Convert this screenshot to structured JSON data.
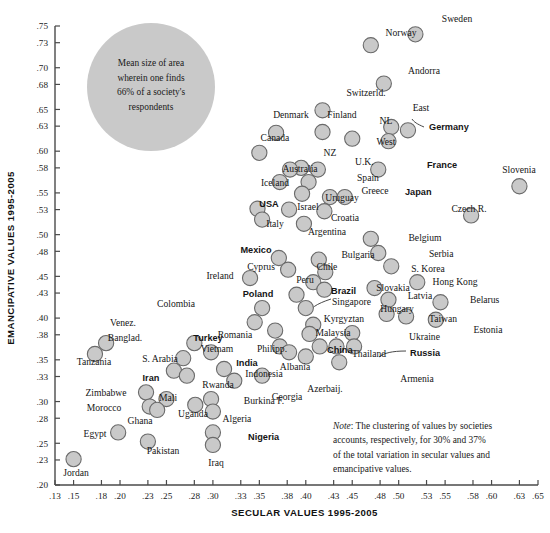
{
  "chart_data": {
    "type": "scatter",
    "title": "",
    "xlabel": "SECULAR VALUES 1995-2005",
    "ylabel": "EMANCIPATIVE VALUES 1995-2005",
    "xlim": [
      0.13,
      0.65
    ],
    "ylim": [
      0.2,
      0.75
    ],
    "grid": false,
    "legend": null,
    "xticks": [
      ".13",
      ".15",
      ".18",
      ".20",
      ".23",
      ".25",
      ".28",
      ".30",
      ".33",
      ".35",
      ".38",
      ".40",
      ".43",
      ".45",
      ".48",
      ".50",
      ".53",
      ".55",
      ".58",
      ".60",
      ".63",
      ".65"
    ],
    "xtick_values": [
      0.13,
      0.15,
      0.18,
      0.2,
      0.23,
      0.25,
      0.28,
      0.3,
      0.33,
      0.35,
      0.38,
      0.4,
      0.43,
      0.45,
      0.48,
      0.5,
      0.53,
      0.55,
      0.58,
      0.6,
      0.63,
      0.65
    ],
    "yticks": [
      ".75",
      ".73",
      ".70",
      ".68",
      ".65",
      ".63",
      ".60",
      ".58",
      ".55",
      ".53",
      ".50",
      ".48",
      ".45",
      ".43",
      ".40",
      ".38",
      ".35",
      ".33",
      ".30",
      ".28",
      ".25",
      ".23",
      ".20"
    ],
    "ytick_values": [
      0.75,
      0.73,
      0.7,
      0.68,
      0.65,
      0.63,
      0.6,
      0.58,
      0.55,
      0.53,
      0.5,
      0.48,
      0.45,
      0.43,
      0.4,
      0.38,
      0.35,
      0.33,
      0.3,
      0.28,
      0.25,
      0.23,
      0.2
    ],
    "marker_fill": "#c9c9c9",
    "marker_stroke": "#6a6a6a",
    "points": [
      {
        "label": "Sweden",
        "x": 0.518,
        "y": 0.74,
        "bold": false,
        "lx": 457,
        "ly": 22,
        "anchor": "middle"
      },
      {
        "label": "Norway",
        "x": 0.47,
        "y": 0.727,
        "bold": false,
        "lx": 401,
        "ly": 36,
        "anchor": "middle"
      },
      {
        "label": "Andorra",
        "x": 0.484,
        "y": 0.681,
        "bold": false,
        "lx": 424,
        "ly": 74,
        "anchor": "middle"
      },
      {
        "label": "Switzerld.",
        "x": 0.418,
        "y": 0.649,
        "bold": false,
        "lx": 366,
        "ly": 96,
        "anchor": "middle"
      },
      {
        "label": "Denmark",
        "x": 0.368,
        "y": 0.622,
        "bold": false,
        "lx": 291,
        "ly": 118,
        "anchor": "middle"
      },
      {
        "label": "Finland",
        "x": 0.418,
        "y": 0.623,
        "bold": false,
        "lx": 342,
        "ly": 118,
        "anchor": "middle"
      },
      {
        "label": "NL",
        "x": 0.45,
        "y": 0.615,
        "bold": false,
        "lx": 386,
        "ly": 124,
        "anchor": "middle"
      },
      {
        "label": "East",
        "x": 0.492,
        "y": 0.629,
        "bold": false,
        "lx": 421,
        "ly": 111,
        "anchor": "middle"
      },
      {
        "label": "Germany",
        "x": 0.51,
        "y": 0.625,
        "bold": true,
        "lx": 429,
        "ly": 130,
        "anchor": "start"
      },
      {
        "label": "West",
        "x": 0.489,
        "y": 0.612,
        "bold": false,
        "lx": 386,
        "ly": 145,
        "anchor": "middle"
      },
      {
        "label": "Canada",
        "x": 0.35,
        "y": 0.598,
        "bold": false,
        "lx": 275,
        "ly": 141,
        "anchor": "middle"
      },
      {
        "label": "NZ",
        "x": 0.395,
        "y": 0.58,
        "bold": false,
        "lx": 330,
        "ly": 156,
        "anchor": "middle"
      },
      {
        "label": "U.K.",
        "x": 0.413,
        "y": 0.578,
        "bold": false,
        "lx": 355,
        "ly": 165,
        "anchor": "start"
      },
      {
        "label": "Australia",
        "x": 0.383,
        "y": 0.578,
        "bold": false,
        "lx": 300,
        "ly": 172,
        "anchor": "middle"
      },
      {
        "label": "France",
        "x": 0.478,
        "y": 0.578,
        "bold": true,
        "lx": 427,
        "ly": 168,
        "anchor": "start"
      },
      {
        "label": "Iceland",
        "x": 0.372,
        "y": 0.563,
        "bold": false,
        "lx": 275,
        "ly": 186,
        "anchor": "middle"
      },
      {
        "label": "Spain",
        "x": 0.403,
        "y": 0.563,
        "bold": false,
        "lx": 357,
        "ly": 181,
        "anchor": "start"
      },
      {
        "label": "Slovenia",
        "x": 0.63,
        "y": 0.558,
        "bold": false,
        "lx": 519,
        "ly": 173,
        "anchor": "middle"
      },
      {
        "label": "Uruguay",
        "x": 0.396,
        "y": 0.549,
        "bold": false,
        "lx": 342,
        "ly": 201,
        "anchor": "middle"
      },
      {
        "label": "Greece",
        "x": 0.426,
        "y": 0.545,
        "bold": false,
        "lx": 375,
        "ly": 194,
        "anchor": "middle"
      },
      {
        "label": "Japan",
        "x": 0.442,
        "y": 0.545,
        "bold": true,
        "lx": 405,
        "ly": 195,
        "anchor": "start"
      },
      {
        "label": "USA",
        "x": 0.348,
        "y": 0.531,
        "bold": true,
        "lx": 269,
        "ly": 207,
        "anchor": "middle"
      },
      {
        "label": "Israel",
        "x": 0.382,
        "y": 0.53,
        "bold": false,
        "lx": 308,
        "ly": 210,
        "anchor": "middle"
      },
      {
        "label": "Croatia",
        "x": 0.42,
        "y": 0.528,
        "bold": false,
        "lx": 345,
        "ly": 221,
        "anchor": "middle"
      },
      {
        "label": "Czech R.",
        "x": 0.578,
        "y": 0.523,
        "bold": false,
        "lx": 469,
        "ly": 212,
        "anchor": "middle"
      },
      {
        "label": "Italy",
        "x": 0.353,
        "y": 0.518,
        "bold": false,
        "lx": 275,
        "ly": 227,
        "anchor": "middle"
      },
      {
        "label": "Argentina",
        "x": 0.398,
        "y": 0.513,
        "bold": false,
        "lx": 327,
        "ly": 235,
        "anchor": "middle"
      },
      {
        "label": "Belgium",
        "x": 0.47,
        "y": 0.495,
        "bold": false,
        "lx": 425,
        "ly": 241,
        "anchor": "middle"
      },
      {
        "label": "Mexico",
        "x": 0.371,
        "y": 0.472,
        "bold": true,
        "lx": 256,
        "ly": 253,
        "anchor": "middle"
      },
      {
        "label": "Bulgaria",
        "x": 0.414,
        "y": 0.47,
        "bold": false,
        "lx": 358,
        "ly": 258,
        "anchor": "middle"
      },
      {
        "label": "Serbia",
        "x": 0.478,
        "y": 0.478,
        "bold": false,
        "lx": 429,
        "ly": 257,
        "anchor": "start"
      },
      {
        "label": "Cyprus",
        "x": 0.381,
        "y": 0.458,
        "bold": false,
        "lx": 261,
        "ly": 270,
        "anchor": "middle"
      },
      {
        "label": "Chile",
        "x": 0.421,
        "y": 0.455,
        "bold": false,
        "lx": 327,
        "ly": 270,
        "anchor": "middle"
      },
      {
        "label": "S. Korea",
        "x": 0.492,
        "y": 0.462,
        "bold": false,
        "lx": 428,
        "ly": 272,
        "anchor": "middle"
      },
      {
        "label": "Ireland",
        "x": 0.34,
        "y": 0.448,
        "bold": false,
        "lx": 220,
        "ly": 279,
        "anchor": "middle"
      },
      {
        "label": "Peru",
        "x": 0.408,
        "y": 0.443,
        "bold": false,
        "lx": 305,
        "ly": 283,
        "anchor": "middle"
      },
      {
        "label": "Hong Kong",
        "x": 0.52,
        "y": 0.443,
        "bold": false,
        "lx": 455,
        "ly": 285,
        "anchor": "middle"
      },
      {
        "label": "Brazil",
        "x": 0.42,
        "y": 0.434,
        "bold": true,
        "lx": 331,
        "ly": 294,
        "anchor": "start"
      },
      {
        "label": "Slovakia",
        "x": 0.474,
        "y": 0.436,
        "bold": false,
        "lx": 393,
        "ly": 291,
        "anchor": "middle"
      },
      {
        "label": "Poland",
        "x": 0.39,
        "y": 0.428,
        "bold": true,
        "lx": 258,
        "ly": 297,
        "anchor": "middle"
      },
      {
        "label": "Latvia",
        "x": 0.489,
        "y": 0.422,
        "bold": false,
        "lx": 420,
        "ly": 299,
        "anchor": "middle"
      },
      {
        "label": "Belarus",
        "x": 0.545,
        "y": 0.419,
        "bold": false,
        "lx": 470,
        "ly": 303,
        "anchor": "start"
      },
      {
        "label": "Colombia",
        "x": 0.353,
        "y": 0.412,
        "bold": false,
        "lx": 176,
        "ly": 307,
        "anchor": "middle"
      },
      {
        "label": "Singapore",
        "x": 0.4,
        "y": 0.412,
        "bold": false,
        "lx": 332,
        "ly": 305,
        "anchor": "start"
      },
      {
        "label": "Hungary",
        "x": 0.487,
        "y": 0.405,
        "bold": false,
        "lx": 397,
        "ly": 312,
        "anchor": "middle"
      },
      {
        "label": "Taiwan",
        "x": 0.508,
        "y": 0.402,
        "bold": false,
        "lx": 443,
        "ly": 322,
        "anchor": "middle"
      },
      {
        "label": "Estonia",
        "x": 0.54,
        "y": 0.398,
        "bold": false,
        "lx": 488,
        "ly": 333,
        "anchor": "middle"
      },
      {
        "label": "Venez.",
        "x": 0.345,
        "y": 0.395,
        "bold": false,
        "lx": 123,
        "ly": 326,
        "anchor": "middle"
      },
      {
        "label": "Kyrgyztan",
        "x": 0.408,
        "y": 0.392,
        "bold": false,
        "lx": 344,
        "ly": 322,
        "anchor": "middle"
      },
      {
        "label": "Romania",
        "x": 0.367,
        "y": 0.385,
        "bold": false,
        "lx": 235,
        "ly": 338,
        "anchor": "middle"
      },
      {
        "label": "Malaysia",
        "x": 0.404,
        "y": 0.381,
        "bold": false,
        "lx": 333,
        "ly": 336,
        "anchor": "middle"
      },
      {
        "label": "Ukraine",
        "x": 0.45,
        "y": 0.382,
        "bold": false,
        "lx": 409,
        "ly": 340,
        "anchor": "start"
      },
      {
        "label": "Banglad.",
        "x": 0.185,
        "y": 0.37,
        "bold": false,
        "lx": 125,
        "ly": 341,
        "anchor": "middle"
      },
      {
        "label": "Turkey",
        "x": 0.28,
        "y": 0.37,
        "bold": true,
        "lx": 208,
        "ly": 341,
        "anchor": "middle"
      },
      {
        "label": "Philipp.",
        "x": 0.372,
        "y": 0.366,
        "bold": false,
        "lx": 272,
        "ly": 352,
        "anchor": "middle"
      },
      {
        "label": "Vietnam",
        "x": 0.298,
        "y": 0.359,
        "bold": false,
        "lx": 217,
        "ly": 352,
        "anchor": "middle"
      },
      {
        "label": "India",
        "x": 0.382,
        "y": 0.359,
        "bold": true,
        "lx": 247,
        "ly": 366,
        "anchor": "middle"
      },
      {
        "label": "China",
        "x": 0.415,
        "y": 0.366,
        "bold": true,
        "lx": 327,
        "ly": 353,
        "anchor": "start"
      },
      {
        "label": "Thailand",
        "x": 0.433,
        "y": 0.366,
        "bold": false,
        "lx": 352,
        "ly": 357,
        "anchor": "start"
      },
      {
        "label": "Russia",
        "x": 0.452,
        "y": 0.366,
        "bold": true,
        "lx": 410,
        "ly": 356,
        "anchor": "start"
      },
      {
        "label": "Tanzania",
        "x": 0.173,
        "y": 0.357,
        "bold": false,
        "lx": 94,
        "ly": 365,
        "anchor": "middle"
      },
      {
        "label": "S. Arabia",
        "x": 0.268,
        "y": 0.352,
        "bold": false,
        "lx": 160,
        "ly": 362,
        "anchor": "middle"
      },
      {
        "label": "Albania",
        "x": 0.4,
        "y": 0.354,
        "bold": false,
        "lx": 295,
        "ly": 370,
        "anchor": "middle"
      },
      {
        "label": "Iran",
        "x": 0.258,
        "y": 0.337,
        "bold": true,
        "lx": 151,
        "ly": 381,
        "anchor": "middle"
      },
      {
        "label": "Indonesia",
        "x": 0.312,
        "y": 0.339,
        "bold": false,
        "lx": 264,
        "ly": 377,
        "anchor": "middle"
      },
      {
        "label": "Armenia",
        "x": 0.436,
        "y": 0.347,
        "bold": false,
        "lx": 417,
        "ly": 382,
        "anchor": "middle"
      },
      {
        "label": "Rwanda",
        "x": 0.272,
        "y": 0.331,
        "bold": false,
        "lx": 218,
        "ly": 388,
        "anchor": "middle"
      },
      {
        "label": "Azerbaij.",
        "x": 0.353,
        "y": 0.331,
        "bold": false,
        "lx": 325,
        "ly": 392,
        "anchor": "middle"
      },
      {
        "label": "Georgia",
        "x": 0.323,
        "y": 0.325,
        "bold": false,
        "lx": 287,
        "ly": 400,
        "anchor": "middle"
      },
      {
        "label": "Zimbabwe",
        "x": 0.228,
        "y": 0.311,
        "bold": false,
        "lx": 106,
        "ly": 396,
        "anchor": "middle"
      },
      {
        "label": "Mali",
        "x": 0.25,
        "y": 0.303,
        "bold": false,
        "lx": 168,
        "ly": 401,
        "anchor": "middle"
      },
      {
        "label": "Burkina F.",
        "x": 0.298,
        "y": 0.303,
        "bold": false,
        "lx": 264,
        "ly": 404,
        "anchor": "middle"
      },
      {
        "label": "Morocco",
        "x": 0.232,
        "y": 0.294,
        "bold": false,
        "lx": 104,
        "ly": 411,
        "anchor": "middle"
      },
      {
        "label": "Uganda",
        "x": 0.281,
        "y": 0.296,
        "bold": false,
        "lx": 193,
        "ly": 417,
        "anchor": "middle"
      },
      {
        "label": "Ghana",
        "x": 0.24,
        "y": 0.29,
        "bold": false,
        "lx": 140,
        "ly": 424,
        "anchor": "middle"
      },
      {
        "label": "Algeria",
        "x": 0.3,
        "y": 0.288,
        "bold": false,
        "lx": 237,
        "ly": 422,
        "anchor": "middle"
      },
      {
        "label": "Egypt",
        "x": 0.198,
        "y": 0.263,
        "bold": false,
        "lx": 95,
        "ly": 437,
        "anchor": "middle"
      },
      {
        "label": "Nigeria",
        "x": 0.3,
        "y": 0.263,
        "bold": true,
        "lx": 248,
        "ly": 440,
        "anchor": "start"
      },
      {
        "label": "Pakistan",
        "x": 0.23,
        "y": 0.252,
        "bold": false,
        "lx": 163,
        "ly": 454,
        "anchor": "middle"
      },
      {
        "label": "Iraq",
        "x": 0.3,
        "y": 0.248,
        "bold": false,
        "lx": 216,
        "ly": 466,
        "anchor": "middle"
      },
      {
        "label": "Jordan",
        "x": 0.15,
        "y": 0.231,
        "bold": false,
        "lx": 76,
        "ly": 476,
        "anchor": "middle"
      }
    ],
    "annotations": [
      {
        "name": "reference-bubble",
        "lines": [
          "Mean size of area",
          "wherein one finds",
          "66% of a society's",
          "respondents"
        ]
      },
      {
        "name": "note",
        "italic_lead": "Note",
        "lines": [
          ": The clustering of values by societies",
          "accounts, respectively, for 30% and 37%",
          "of the total variation in secular values and",
          "emancipative values."
        ]
      }
    ]
  }
}
